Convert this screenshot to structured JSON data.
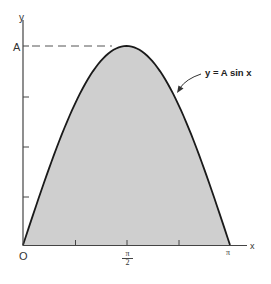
{
  "chart_data": {
    "type": "area",
    "title": "",
    "function": "y = A sin x",
    "xlabel": "x",
    "ylabel": "y",
    "x_ticks": [
      "0",
      "π/2",
      "π"
    ],
    "y_ticks": [
      "A"
    ],
    "x_range": [
      0,
      3.14159
    ],
    "y_range": [
      0,
      1
    ],
    "x": [
      0,
      0.3927,
      0.7854,
      1.1781,
      1.5708,
      1.9635,
      2.3562,
      2.7489,
      3.14159
    ],
    "values": [
      0,
      0.383,
      0.707,
      0.924,
      1.0,
      0.924,
      0.707,
      0.383,
      0
    ],
    "fill_color": "#cfcfcf",
    "line_color": "#1a1a1a",
    "annotations": [
      {
        "text": "y = A sin x",
        "arrow_to": "curve near x ≈ 2.4"
      },
      {
        "text": "dashed line from y-axis at A to peak at x = π/2"
      }
    ],
    "grid": false,
    "legend": "none"
  },
  "labels": {
    "y_axis": "y",
    "x_axis": "x",
    "origin": "O",
    "amplitude": "A",
    "half_pi_num": "π",
    "half_pi_den": "2",
    "pi": "π",
    "equation": "y = A sin x"
  }
}
